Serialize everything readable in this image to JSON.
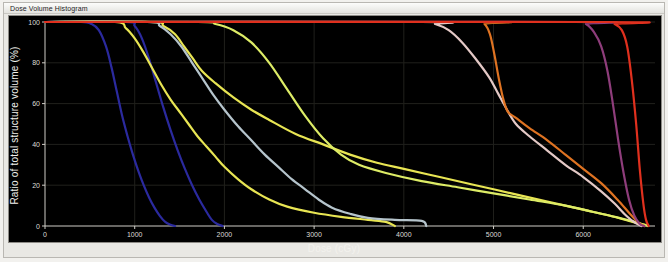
{
  "window": {
    "title": "Dose Volume Histogram"
  },
  "chart_data": {
    "type": "line",
    "title": "Dose Volume Histogram",
    "xlabel": "Dose (cGy)",
    "ylabel": "Ratio of total structure volume (%)",
    "xlim": [
      0,
      6800
    ],
    "ylim": [
      0,
      100
    ],
    "xticks": [
      0,
      1000,
      2000,
      3000,
      4000,
      5000,
      6000
    ],
    "yticks": [
      0,
      20,
      40,
      60,
      80,
      100
    ],
    "grid": true,
    "background": "#000000",
    "legend": "none",
    "series": [
      {
        "name": "dark-blue-1",
        "color": "#2b2a9e",
        "points": [
          [
            0,
            100
          ],
          [
            400,
            100
          ],
          [
            520,
            99
          ],
          [
            600,
            96
          ],
          [
            680,
            88
          ],
          [
            740,
            78
          ],
          [
            800,
            66
          ],
          [
            860,
            54
          ],
          [
            920,
            44
          ],
          [
            980,
            35
          ],
          [
            1040,
            27
          ],
          [
            1100,
            20
          ],
          [
            1160,
            14
          ],
          [
            1220,
            9
          ],
          [
            1280,
            5
          ],
          [
            1340,
            2
          ],
          [
            1400,
            0.6
          ],
          [
            1450,
            0
          ]
        ]
      },
      {
        "name": "dark-blue-2",
        "color": "#2b2a9e",
        "points": [
          [
            0,
            100
          ],
          [
            900,
            100
          ],
          [
            1000,
            98
          ],
          [
            1080,
            92
          ],
          [
            1160,
            82
          ],
          [
            1240,
            70
          ],
          [
            1320,
            58
          ],
          [
            1400,
            47
          ],
          [
            1480,
            37
          ],
          [
            1560,
            28
          ],
          [
            1640,
            20
          ],
          [
            1720,
            13
          ],
          [
            1800,
            7
          ],
          [
            1860,
            3
          ],
          [
            1920,
            1
          ],
          [
            1980,
            0
          ]
        ]
      },
      {
        "name": "yellow-1",
        "color": "#e8e553",
        "points": [
          [
            0,
            100
          ],
          [
            780,
            100
          ],
          [
            900,
            97
          ],
          [
            1000,
            92
          ],
          [
            1100,
            85
          ],
          [
            1200,
            77
          ],
          [
            1300,
            69
          ],
          [
            1400,
            62
          ],
          [
            1500,
            56
          ],
          [
            1600,
            50
          ],
          [
            1700,
            44
          ],
          [
            1800,
            39
          ],
          [
            1900,
            34
          ],
          [
            2000,
            29
          ],
          [
            2150,
            23
          ],
          [
            2300,
            18
          ],
          [
            2500,
            13
          ],
          [
            2700,
            9.5
          ],
          [
            3000,
            6.5
          ],
          [
            3300,
            4.5
          ],
          [
            3600,
            3
          ],
          [
            3800,
            2
          ],
          [
            3900,
            0
          ]
        ]
      },
      {
        "name": "yellow-2",
        "color": "#e8e553",
        "points": [
          [
            0,
            100
          ],
          [
            1180,
            100
          ],
          [
            1320,
            98
          ],
          [
            1450,
            94
          ],
          [
            1550,
            88
          ],
          [
            1650,
            82
          ],
          [
            1750,
            76
          ],
          [
            1900,
            70
          ],
          [
            2100,
            63
          ],
          [
            2300,
            57
          ],
          [
            2500,
            52
          ],
          [
            2800,
            45
          ],
          [
            3100,
            40
          ],
          [
            3400,
            35
          ],
          [
            3700,
            31
          ],
          [
            4000,
            28
          ],
          [
            4400,
            24
          ],
          [
            4800,
            20
          ],
          [
            5200,
            16
          ],
          [
            5600,
            12
          ],
          [
            6000,
            8
          ],
          [
            6300,
            5
          ],
          [
            6550,
            2
          ],
          [
            6700,
            0.5
          ]
        ]
      },
      {
        "name": "light-blue-gray",
        "color": "#b5c4cc",
        "points": [
          [
            0,
            100
          ],
          [
            1140,
            100
          ],
          [
            1280,
            98
          ],
          [
            1400,
            94
          ],
          [
            1520,
            88
          ],
          [
            1640,
            80
          ],
          [
            1760,
            72
          ],
          [
            1880,
            64
          ],
          [
            2000,
            57
          ],
          [
            2150,
            49
          ],
          [
            2300,
            42
          ],
          [
            2450,
            35
          ],
          [
            2600,
            29
          ],
          [
            2750,
            23
          ],
          [
            2900,
            18
          ],
          [
            3050,
            13
          ],
          [
            3200,
            9
          ],
          [
            3400,
            6
          ],
          [
            3600,
            4
          ],
          [
            3900,
            3
          ],
          [
            4200,
            2.5
          ],
          [
            4250,
            0
          ]
        ]
      },
      {
        "name": "yellow-green-3",
        "color": "#ddec66",
        "points": [
          [
            0,
            100
          ],
          [
            1700,
            100
          ],
          [
            1900,
            99
          ],
          [
            2100,
            96
          ],
          [
            2300,
            90
          ],
          [
            2500,
            80
          ],
          [
            2700,
            67
          ],
          [
            2900,
            54
          ],
          [
            3100,
            43
          ],
          [
            3300,
            35
          ],
          [
            3500,
            30
          ],
          [
            3800,
            26
          ],
          [
            4200,
            22
          ],
          [
            4600,
            19
          ],
          [
            5000,
            16
          ],
          [
            5400,
            13
          ],
          [
            5800,
            10
          ],
          [
            6100,
            7
          ],
          [
            6400,
            4
          ],
          [
            6620,
            1.5
          ],
          [
            6720,
            0
          ]
        ]
      },
      {
        "name": "pale-pink",
        "color": "#e4c9c6",
        "points": [
          [
            0,
            100
          ],
          [
            4200,
            100
          ],
          [
            4350,
            99
          ],
          [
            4500,
            96
          ],
          [
            4650,
            90
          ],
          [
            4800,
            82
          ],
          [
            4950,
            73
          ],
          [
            5050,
            65
          ],
          [
            5150,
            57
          ],
          [
            5250,
            50
          ],
          [
            5400,
            44
          ],
          [
            5600,
            37
          ],
          [
            5800,
            30
          ],
          [
            6000,
            24
          ],
          [
            6200,
            17
          ],
          [
            6350,
            11
          ],
          [
            6480,
            5
          ],
          [
            6580,
            1.5
          ],
          [
            6650,
            0
          ]
        ]
      },
      {
        "name": "orange",
        "color": "#df7322",
        "points": [
          [
            0,
            100
          ],
          [
            4820,
            100
          ],
          [
            4900,
            99
          ],
          [
            4960,
            94
          ],
          [
            5010,
            84
          ],
          [
            5060,
            72
          ],
          [
            5110,
            62
          ],
          [
            5160,
            56
          ],
          [
            5250,
            53
          ],
          [
            5400,
            48
          ],
          [
            5600,
            42
          ],
          [
            5800,
            35
          ],
          [
            6000,
            28
          ],
          [
            6200,
            21
          ],
          [
            6380,
            13
          ],
          [
            6520,
            6
          ],
          [
            6620,
            1.5
          ],
          [
            6680,
            0
          ]
        ]
      },
      {
        "name": "purple-magenta",
        "color": "#8e3d7b",
        "points": [
          [
            0,
            100
          ],
          [
            5900,
            100
          ],
          [
            6030,
            99
          ],
          [
            6120,
            95
          ],
          [
            6200,
            88
          ],
          [
            6270,
            76
          ],
          [
            6330,
            60
          ],
          [
            6390,
            42
          ],
          [
            6450,
            26
          ],
          [
            6510,
            13
          ],
          [
            6570,
            5
          ],
          [
            6630,
            1
          ],
          [
            6680,
            0
          ]
        ]
      },
      {
        "name": "bright-red",
        "color": "#e0301e",
        "points": [
          [
            0,
            100
          ],
          [
            6250,
            100
          ],
          [
            6350,
            99
          ],
          [
            6430,
            96
          ],
          [
            6490,
            88
          ],
          [
            6540,
            72
          ],
          [
            6590,
            50
          ],
          [
            6630,
            28
          ],
          [
            6670,
            11
          ],
          [
            6700,
            3
          ],
          [
            6730,
            0
          ]
        ]
      }
    ]
  }
}
